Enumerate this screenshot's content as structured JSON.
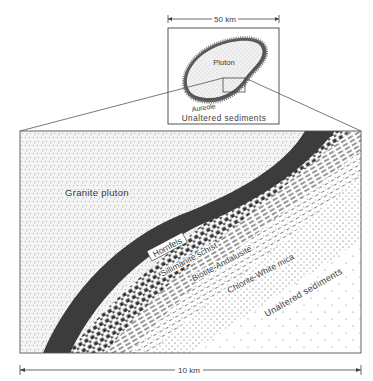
{
  "inset": {
    "scale_label": "50 km",
    "pluton_label": "Pluton",
    "aureole_label": "Aureole",
    "sediments_label": "Unaltered sediments"
  },
  "main": {
    "granite_label": "Granite pluton",
    "zones": [
      {
        "label": "Hornfels"
      },
      {
        "label": "Sillimanite schist"
      },
      {
        "label": "Biotite-Andalusite"
      },
      {
        "label": "Chlorite-White mica"
      }
    ],
    "sediments_label": "Unaltered sediments",
    "scale_label": "10 km"
  },
  "colors": {
    "ink": "#3a3a3a",
    "hornfels_fill": "#3c3c3c",
    "granite_speckle": "#9a9a9a",
    "background": "#ffffff"
  }
}
